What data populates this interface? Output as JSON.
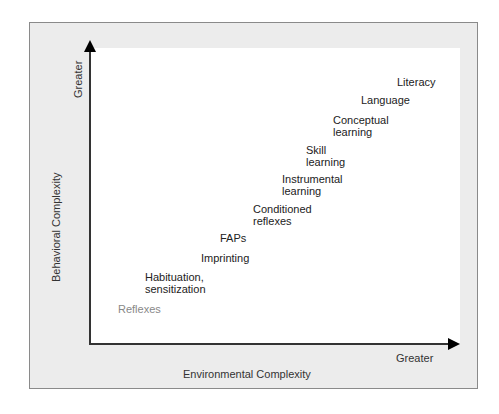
{
  "diagram": {
    "y_axis": {
      "title": "Behavioral Complexity",
      "end_label": "Greater"
    },
    "x_axis": {
      "title": "Environmental Complexity",
      "end_label": "Greater"
    },
    "items": [
      {
        "line1": "Reflexes",
        "line2": "",
        "x": 118,
        "y": 303,
        "light": true
      },
      {
        "line1": "Habituation,",
        "line2": "sensitization",
        "x": 145,
        "y": 271
      },
      {
        "line1": "Imprinting",
        "line2": "",
        "x": 201,
        "y": 252
      },
      {
        "line1": "FAPs",
        "line2": "",
        "x": 220,
        "y": 232
      },
      {
        "line1": "Conditioned",
        "line2": "reflexes",
        "x": 253,
        "y": 203
      },
      {
        "line1": "Instrumental",
        "line2": "learning",
        "x": 282,
        "y": 173
      },
      {
        "line1": "Skill",
        "line2": "learning",
        "x": 306,
        "y": 144
      },
      {
        "line1": "Conceptual",
        "line2": "learning",
        "x": 333,
        "y": 114
      },
      {
        "line1": "Language",
        "line2": "",
        "x": 361,
        "y": 94
      },
      {
        "line1": "Literacy",
        "line2": "",
        "x": 397,
        "y": 76
      }
    ],
    "colors": {
      "frame": "#ececec",
      "frame_border": "#8a8a8a",
      "plot": "#ffffff",
      "axis": "#333333",
      "reflexes_text": "#888888"
    }
  }
}
